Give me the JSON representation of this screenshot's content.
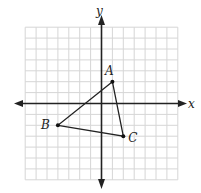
{
  "diagram": {
    "type": "coordinate-plane",
    "axes": {
      "x_label": "x",
      "y_label": "y"
    },
    "grid": {
      "x_min": -7,
      "x_max": 7,
      "y_min": -7,
      "y_max": 7,
      "step": 1
    },
    "triangle": {
      "points": [
        {
          "label": "A",
          "x": 1,
          "y": 2
        },
        {
          "label": "B",
          "x": -4,
          "y": -2
        },
        {
          "label": "C",
          "x": 2,
          "y": -3
        }
      ]
    }
  },
  "colors": {
    "axis": "#222222",
    "grid": "#d6d6d6",
    "triangle": "#222222"
  }
}
